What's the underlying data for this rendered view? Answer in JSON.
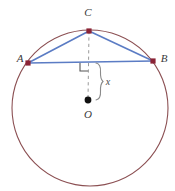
{
  "diagram": {
    "canvas": {
      "width": 175,
      "height": 191,
      "background": "#ffffff"
    },
    "colors": {
      "circle_stroke": "#8B4F52",
      "chord_stroke": "#5B7CC4",
      "point_marker": "#8B2335",
      "center_marker": "#111111",
      "dashed_stroke": "#9a9a9a",
      "right_angle_stroke": "#555555",
      "brace_stroke": "#8a8a8a",
      "label_fill": "#3a3a3a"
    },
    "circle": {
      "name": "circumscribed-circle",
      "center_x": 90,
      "center_y": 108,
      "radius": 78
    },
    "points": [
      {
        "id": "A",
        "label": "A",
        "x": 28,
        "y": 63,
        "label_x": 20,
        "label_y": 62,
        "marker": "square"
      },
      {
        "id": "B",
        "label": "B",
        "x": 153,
        "y": 61,
        "label_x": 164,
        "label_y": 62,
        "marker": "square"
      },
      {
        "id": "C",
        "label": "C",
        "x": 89,
        "y": 31,
        "label_x": 88,
        "label_y": 16,
        "marker": "square"
      },
      {
        "id": "O",
        "label": "O",
        "x": 88,
        "y": 100,
        "label_x": 88,
        "label_y": 118,
        "marker": "dot"
      }
    ],
    "segments": [
      {
        "id": "AB",
        "label": "chord-ab",
        "x1": 28,
        "y1": 63,
        "x2": 153,
        "y2": 61
      },
      {
        "id": "AC",
        "label": "chord-ac",
        "x1": 28,
        "y1": 63,
        "x2": 89,
        "y2": 31
      },
      {
        "id": "CB",
        "label": "chord-cb",
        "x1": 89,
        "y1": 31,
        "x2": 153,
        "y2": 61
      }
    ],
    "dashed_segment": {
      "id": "CO",
      "label": "apothem-dashed-line",
      "x1": 89,
      "y1": 31,
      "x2": 88,
      "y2": 100
    },
    "right_angle": {
      "label": "right-angle-marker",
      "x": 80,
      "y": 63,
      "size": 8
    },
    "brace": {
      "label": "measure-brace",
      "x": 99,
      "y_top": 63,
      "y_bottom": 100
    },
    "measure": {
      "label": "x",
      "label_x": 108,
      "label_y": 85
    }
  }
}
